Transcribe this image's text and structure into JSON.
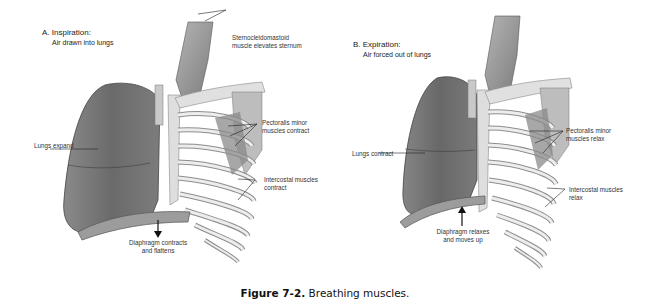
{
  "figure": {
    "caption_label": "Figure 7-2.",
    "caption_text": " Breathing muscles."
  },
  "panels": [
    {
      "id": "A",
      "title": "A. Inspiration:",
      "subtitle": "Air drawn into lungs",
      "labels": {
        "sternocleidomastoid_1": "Sternocleidomastoid",
        "sternocleidomastoid_2": "muscle elevates sternum",
        "lungs": "Lungs expand",
        "pectoralis_1": "Pectoralis minor",
        "pectoralis_2": "muscles contract",
        "intercostal_1": "Intercostal muscles",
        "intercostal_2": "contract",
        "diaphragm_1": "Diaphragm contracts",
        "diaphragm_2": "and flattens"
      },
      "diaphragm_arrow": "down"
    },
    {
      "id": "B",
      "title": "B. Expiration:",
      "subtitle": "Air forced out of lungs",
      "labels": {
        "lungs": "Lungs contract",
        "pectoralis_1": "Pectoralis minor",
        "pectoralis_2": "muscles relax",
        "intercostal_1": "Intercostal muscles",
        "intercostal_2": "relax",
        "diaphragm_1": "Diaphragm relaxes",
        "diaphragm_2": "and moves up"
      },
      "diaphragm_arrow": "up"
    }
  ],
  "colors": {
    "lung": "#6f6f6f",
    "bone": "#e4e4e2",
    "muscle": "#9a9a9a",
    "line": "#222222"
  }
}
